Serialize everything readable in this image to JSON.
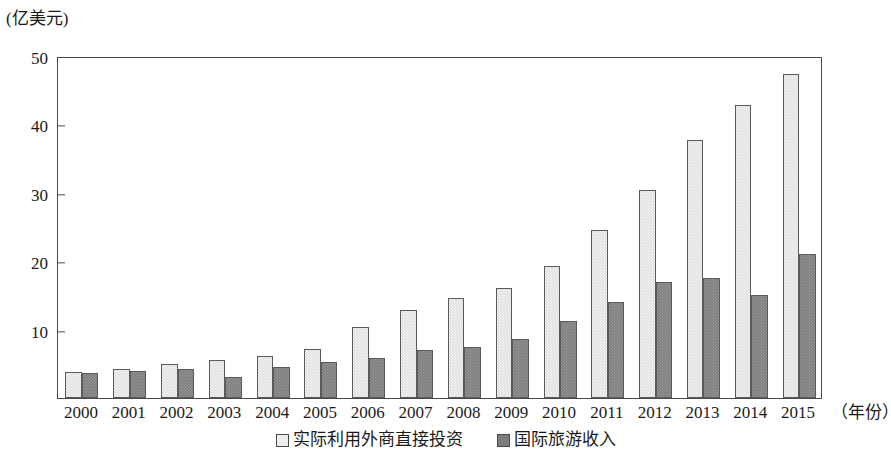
{
  "chart_data": {
    "type": "bar",
    "title": "",
    "subtitle": "",
    "unit_caption": "(亿美元)",
    "xlabel": "（年份）",
    "ylabel": "(亿美元)",
    "ylim": [
      0,
      50
    ],
    "yticks": [
      10,
      20,
      30,
      40,
      50
    ],
    "ytick_labels": [
      "10",
      "20",
      "30",
      "40",
      "50"
    ],
    "grid": false,
    "legend_position": "bottom-center",
    "categories": [
      "2000",
      "2001",
      "2002",
      "2003",
      "2004",
      "2005",
      "2006",
      "2007",
      "2008",
      "2009",
      "2010",
      "2011",
      "2012",
      "2013",
      "2014",
      "2015"
    ],
    "series": [
      {
        "name": "实际利用外商直接投资",
        "color": "#dedede",
        "values": [
          3.8,
          4.3,
          4.9,
          5.5,
          6.2,
          7.2,
          10.4,
          12.9,
          14.6,
          16.1,
          19.3,
          24.5,
          30.4,
          37.7,
          42.8,
          47.4
        ]
      },
      {
        "name": "国际旅游收入",
        "color": "#7d7d7d",
        "values": [
          3.6,
          3.9,
          4.2,
          3.0,
          4.5,
          5.3,
          5.9,
          7.0,
          7.5,
          8.7,
          11.2,
          14.0,
          17.0,
          17.6,
          15.0,
          21.0
        ]
      }
    ]
  },
  "legend": {
    "items": [
      {
        "label": "实际利用外商直接投资",
        "swatch": "light"
      },
      {
        "label": "国际旅游收入",
        "swatch": "dark"
      }
    ]
  }
}
